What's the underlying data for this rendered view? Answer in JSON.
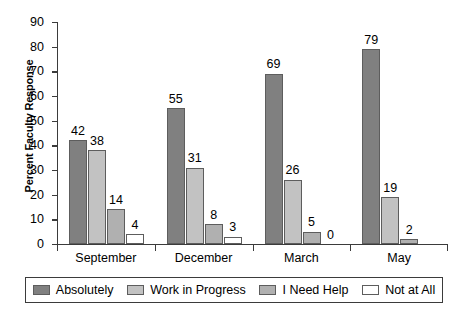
{
  "chart_data": {
    "type": "bar",
    "title": "",
    "subtitle": "",
    "xlabel": "",
    "ylabel": "Percent Faculty Response",
    "ylim": [
      0,
      90
    ],
    "ytick_step": 10,
    "yticks": [
      "0",
      "10",
      "20",
      "30",
      "40",
      "50",
      "60",
      "70",
      "80",
      "90"
    ],
    "grid": false,
    "legend_position": "bottom",
    "categories": [
      "September",
      "December",
      "March",
      "May"
    ],
    "series": [
      {
        "name": "Absolutely",
        "color": "#808080",
        "values": [
          42,
          55,
          69,
          79
        ]
      },
      {
        "name": "Work in Progress",
        "color": "#c2c2c2",
        "values": [
          38,
          31,
          26,
          19
        ]
      },
      {
        "name": "I Need Help",
        "color": "#b0b0b0",
        "values": [
          14,
          8,
          5,
          2
        ]
      },
      {
        "name": "Not at All",
        "color": "#ffffff",
        "values": [
          4,
          3,
          0,
          null
        ]
      }
    ],
    "value_labels": [
      [
        "42",
        "38",
        "14",
        "4"
      ],
      [
        "55",
        "31",
        "8",
        "3"
      ],
      [
        "69",
        "26",
        "5",
        "0"
      ],
      [
        "79",
        "19",
        "2",
        ""
      ]
    ]
  },
  "legend": {
    "items": [
      {
        "label": "Absolutely"
      },
      {
        "label": "Work in Progress"
      },
      {
        "label": "I Need Help"
      },
      {
        "label": "Not at All"
      }
    ]
  }
}
